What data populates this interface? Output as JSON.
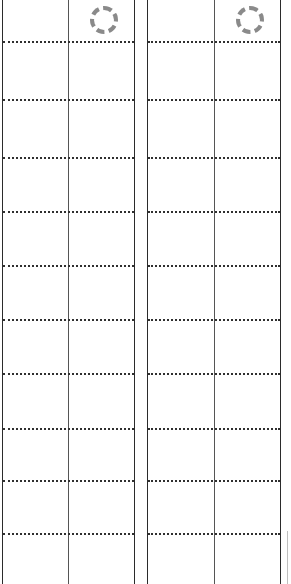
{
  "view": {
    "name": "two-column-grid-sheet",
    "width": 291,
    "height": 584,
    "background_color": "#ffffff",
    "empty": true,
    "cell_text": ""
  },
  "style": {
    "column_rule_color": "#2b2b2b",
    "inner_rule_color": "#555555",
    "row_rule_color": "#2f2f2f",
    "row_rule_style": "dotted",
    "placeholder_color": "#8a8a8a",
    "scroll_stub_color": "#bfbfbf"
  },
  "panels": [
    {
      "id": "panel-left",
      "label": "",
      "left": 2,
      "width": 132,
      "column_rules_x": [
        2,
        68,
        134
      ],
      "placeholder": {
        "icon": "dashed-circle-icon",
        "label": "",
        "left": 90,
        "top": 6,
        "size": 28
      },
      "row_rules_y": [
        41,
        99,
        157,
        211,
        265,
        319,
        373,
        428,
        480,
        533
      ],
      "rows": [
        {
          "index": 0,
          "cells": [
            "",
            ""
          ]
        },
        {
          "index": 1,
          "cells": [
            "",
            ""
          ]
        },
        {
          "index": 2,
          "cells": [
            "",
            ""
          ]
        },
        {
          "index": 3,
          "cells": [
            "",
            ""
          ]
        },
        {
          "index": 4,
          "cells": [
            "",
            ""
          ]
        },
        {
          "index": 5,
          "cells": [
            "",
            ""
          ]
        },
        {
          "index": 6,
          "cells": [
            "",
            ""
          ]
        },
        {
          "index": 7,
          "cells": [
            "",
            ""
          ]
        },
        {
          "index": 8,
          "cells": [
            "",
            ""
          ]
        },
        {
          "index": 9,
          "cells": [
            "",
            ""
          ]
        },
        {
          "index": 10,
          "cells": [
            "",
            ""
          ]
        }
      ]
    },
    {
      "id": "panel-right",
      "label": "",
      "left": 147,
      "width": 133,
      "column_rules_x": [
        147,
        214,
        280
      ],
      "placeholder": {
        "icon": "dashed-circle-icon",
        "label": "",
        "left": 236,
        "top": 6,
        "size": 28
      },
      "row_rules_y": [
        41,
        99,
        157,
        211,
        265,
        319,
        373,
        428,
        480,
        533
      ],
      "rows": [
        {
          "index": 0,
          "cells": [
            "",
            ""
          ]
        },
        {
          "index": 1,
          "cells": [
            "",
            ""
          ]
        },
        {
          "index": 2,
          "cells": [
            "",
            ""
          ]
        },
        {
          "index": 3,
          "cells": [
            "",
            ""
          ]
        },
        {
          "index": 4,
          "cells": [
            "",
            ""
          ]
        },
        {
          "index": 5,
          "cells": [
            "",
            ""
          ]
        },
        {
          "index": 6,
          "cells": [
            "",
            ""
          ]
        },
        {
          "index": 7,
          "cells": [
            "",
            ""
          ]
        },
        {
          "index": 8,
          "cells": [
            "",
            ""
          ]
        },
        {
          "index": 9,
          "cells": [
            "",
            ""
          ]
        },
        {
          "index": 10,
          "cells": [
            "",
            ""
          ]
        }
      ]
    }
  ],
  "scroll_stub": {
    "name": "right-edge-rule",
    "left": 287,
    "top": 531,
    "height": 53
  }
}
